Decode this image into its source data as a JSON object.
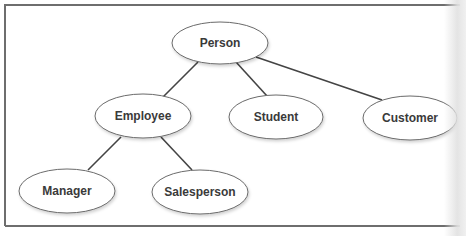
{
  "diagram": {
    "type": "hierarchy",
    "nodes": [
      {
        "id": "person",
        "label": "Person",
        "cx": 220,
        "cy": 43,
        "rx": 48,
        "ry": 21
      },
      {
        "id": "employee",
        "label": "Employee",
        "cx": 143,
        "cy": 116,
        "rx": 48,
        "ry": 22
      },
      {
        "id": "student",
        "label": "Student",
        "cx": 276,
        "cy": 117,
        "rx": 47,
        "ry": 22
      },
      {
        "id": "customer",
        "label": "Customer",
        "cx": 410,
        "cy": 118,
        "rx": 47,
        "ry": 22
      },
      {
        "id": "manager",
        "label": "Manager",
        "cx": 67,
        "cy": 191,
        "rx": 48,
        "ry": 22
      },
      {
        "id": "salesperson",
        "label": "Salesperson",
        "cx": 200,
        "cy": 192,
        "rx": 48,
        "ry": 22
      }
    ],
    "edges": [
      {
        "from": "person",
        "to": "employee",
        "x1": 198,
        "y1": 62,
        "x2": 163,
        "y2": 97
      },
      {
        "from": "person",
        "to": "student",
        "x1": 236,
        "y1": 62,
        "x2": 267,
        "y2": 96
      },
      {
        "from": "person",
        "to": "customer",
        "x1": 256,
        "y1": 57,
        "x2": 382,
        "y2": 100
      },
      {
        "from": "employee",
        "to": "manager",
        "x1": 121,
        "y1": 137,
        "x2": 88,
        "y2": 170
      },
      {
        "from": "employee",
        "to": "salesperson",
        "x1": 161,
        "y1": 137,
        "x2": 192,
        "y2": 170
      }
    ],
    "colors": {
      "frame": "#6e6e6e",
      "edge": "#444444",
      "ellipse_stroke": "#6a6a6a",
      "label": "#3a3a3a",
      "background": "#ffffff"
    }
  }
}
